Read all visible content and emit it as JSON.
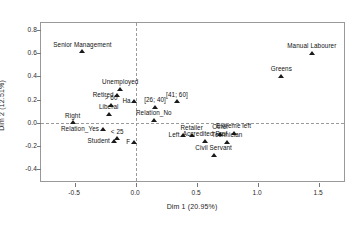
{
  "chart_data": {
    "type": "scatter",
    "title": "",
    "xlabel": "Dim 1 (20.95%)",
    "ylabel": "Dim 2 (12.51%)",
    "xlim": [
      -0.78,
      1.72
    ],
    "ylim": [
      -0.52,
      0.86
    ],
    "xticks": [
      "-0.5",
      "0.0",
      "0.5",
      "1.0",
      "1.5"
    ],
    "xtick_values": [
      -0.5,
      0.0,
      0.5,
      1.0,
      1.5
    ],
    "yticks": [
      "0.8",
      "0.6",
      "0.4",
      "0.2",
      "0.0",
      "-0.2",
      "-0.4"
    ],
    "ytick_values": [
      0.8,
      0.6,
      0.4,
      0.2,
      0.0,
      -0.2,
      -0.4
    ],
    "grid": false,
    "reference_lines": {
      "vertical_x": 0.0,
      "horizontal_y": 0.0,
      "style": "dashed"
    },
    "legend": "none",
    "marker": "triangle",
    "marker_color": "#1a1a1a",
    "points": [
      {
        "label": "Senior Management",
        "x": -0.44,
        "y": 0.615,
        "label_pos": "c"
      },
      {
        "label": "Manual Labourer",
        "x": 1.44,
        "y": 0.605,
        "label_pos": "c"
      },
      {
        "label": "Greens",
        "x": 1.19,
        "y": 0.405,
        "label_pos": "c"
      },
      {
        "label": "Unemployed",
        "x": -0.13,
        "y": 0.295,
        "label_pos": "c"
      },
      {
        "label": "Retired",
        "x": -0.155,
        "y": 0.235,
        "label_pos": "l"
      },
      {
        "label": "> 60",
        "x": -0.205,
        "y": 0.155,
        "label_pos": "c"
      },
      {
        "label": "Ha",
        "x": -0.015,
        "y": 0.185,
        "label_pos": "l"
      },
      {
        "label": "[41; 60]",
        "x": 0.335,
        "y": 0.185,
        "label_pos": "c"
      },
      {
        "label": "[26; 40]",
        "x": 0.155,
        "y": 0.135,
        "label_pos": "c"
      },
      {
        "label": "Liberal",
        "x": -0.225,
        "y": 0.075,
        "label_pos": "c"
      },
      {
        "label": "Relation_No",
        "x": 0.145,
        "y": 0.025,
        "label_pos": "c"
      },
      {
        "label": "Right",
        "x": -0.52,
        "y": 0.005,
        "label_pos": "c"
      },
      {
        "label": "Relation_Yes",
        "x": -0.275,
        "y": -0.055,
        "label_pos": "l"
      },
      {
        "label": "Left",
        "x": 0.385,
        "y": -0.105,
        "label_pos": "l"
      },
      {
        "label": "Retailer",
        "x": 0.455,
        "y": -0.105,
        "label_pos": "c"
      },
      {
        "label": "Other",
        "x": 0.69,
        "y": -0.095,
        "label_pos": "c"
      },
      {
        "label": "Extreme left",
        "x": 0.8,
        "y": -0.085,
        "label_pos": "c"
      },
      {
        "label": "< 25",
        "x": -0.155,
        "y": -0.135,
        "label_pos": "c"
      },
      {
        "label": "Student",
        "x": -0.185,
        "y": -0.155,
        "label_pos": "l"
      },
      {
        "label": "Accredited Prof",
        "x": 0.565,
        "y": -0.155,
        "label_pos": "c"
      },
      {
        "label": "Technician",
        "x": 0.745,
        "y": -0.165,
        "label_pos": "c"
      },
      {
        "label": "F",
        "x": -0.02,
        "y": -0.165,
        "label_pos": "l"
      },
      {
        "label": "Civil Servant",
        "x": 0.635,
        "y": -0.275,
        "label_pos": "c"
      }
    ]
  }
}
